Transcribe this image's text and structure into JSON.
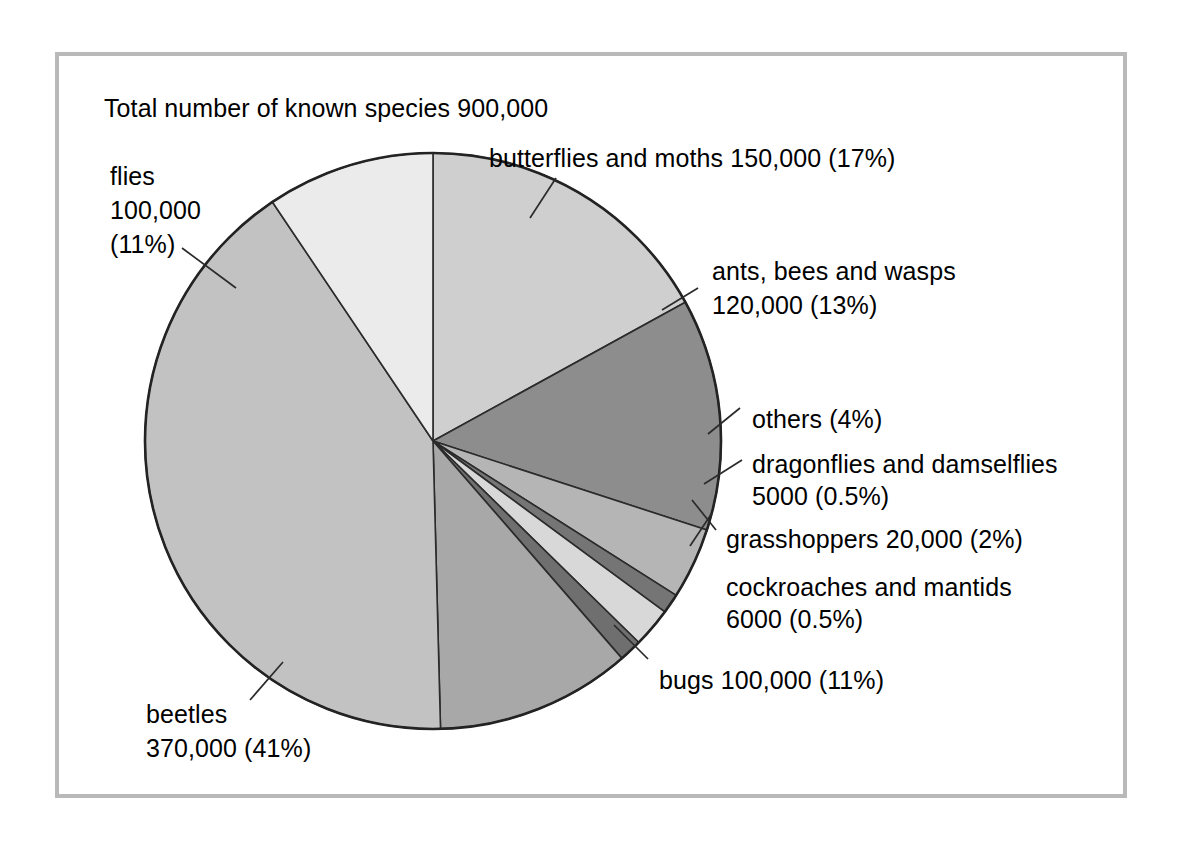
{
  "figure": {
    "title": "Total number of known species 900,000",
    "frame_color": "#b9b9b9",
    "background": "#ffffff",
    "outline_color": "#232323"
  },
  "chart_data": {
    "type": "pie",
    "title": "Total number of known species 900,000",
    "total_label": "900,000",
    "total_value": 900000,
    "units": "species",
    "legend": "none",
    "labels_placement": "callout",
    "categories": [
      "butterflies and moths",
      "ants, bees and wasps",
      "others",
      "dragonflies and damselflies",
      "grasshoppers",
      "cockroaches and mantids",
      "bugs",
      "beetles",
      "flies"
    ],
    "values": [
      150000,
      120000,
      36000,
      5000,
      20000,
      6000,
      100000,
      370000,
      100000
    ],
    "percents": [
      17,
      13,
      4,
      0.5,
      2,
      0.5,
      11,
      41,
      11
    ],
    "slices": [
      {
        "name": "butterflies and moths",
        "value": 150000,
        "value_text": "150,000",
        "percent": 17,
        "percent_text": "(17%)",
        "label": "butterflies and moths 150,000 (17%)",
        "color": "#cfcfcf",
        "start_deg": 0,
        "end_deg": 61.2
      },
      {
        "name": "ants, bees and wasps",
        "value": 120000,
        "value_text": "120,000",
        "percent": 13,
        "percent_text": "(13%)",
        "label_line1": "ants, bees and wasps",
        "label_line2": "120,000 (13%)",
        "color": "#8d8d8d",
        "start_deg": 61.2,
        "end_deg": 108.0
      },
      {
        "name": "others",
        "value": 36000,
        "value_text": "",
        "percent": 4,
        "percent_text": "(4%)",
        "label": "others (4%)",
        "color": "#b5b5b5",
        "start_deg": 108.0,
        "end_deg": 122.4
      },
      {
        "name": "dragonflies and damselflies",
        "value": 5000,
        "value_text": "5000",
        "percent": 0.5,
        "percent_text": "(0.5%)",
        "label_line1": "dragonflies and damselflies",
        "label_line2": "5000 (0.5%)",
        "color": "#757575",
        "start_deg": 122.4,
        "end_deg": 126.4
      },
      {
        "name": "grasshoppers",
        "value": 20000,
        "value_text": "20,000",
        "percent": 2,
        "percent_text": "(2%)",
        "label": "grasshoppers 20,000 (2%)",
        "color": "#d8d8d8",
        "start_deg": 126.4,
        "end_deg": 134.4
      },
      {
        "name": "cockroaches and mantids",
        "value": 6000,
        "value_text": "6000",
        "percent": 0.5,
        "percent_text": "(0.5%)",
        "label_line1": "cockroaches and mantids",
        "label_line2": "6000 (0.5%)",
        "color": "#6f6f6f",
        "start_deg": 134.4,
        "end_deg": 139.0
      },
      {
        "name": "bugs",
        "value": 100000,
        "value_text": "100,000",
        "percent": 11,
        "percent_text": "(11%)",
        "label": "bugs 100,000 (11%)",
        "color": "#a8a8a8",
        "start_deg": 139.0,
        "end_deg": 178.5
      },
      {
        "name": "beetles",
        "value": 370000,
        "value_text": "370,000",
        "percent": 41,
        "percent_text": "(41%)",
        "label_line1": "beetles",
        "label_line2": "370,000 (41%)",
        "color": "#c2c2c2",
        "start_deg": 178.5,
        "end_deg": 326.1
      },
      {
        "name": "flies",
        "value": 100000,
        "value_text": "100,000",
        "percent": 11,
        "percent_text": "(11%)",
        "label_line1": "flies",
        "label_line2": "100,000",
        "label_line3": "(11%)",
        "color": "#ebebeb",
        "start_deg": 326.1,
        "end_deg": 360
      }
    ]
  },
  "labels": {
    "flies_l1": "flies",
    "flies_l2": "100,000",
    "flies_l3": "(11%)",
    "butterflies": "butterflies and moths 150,000 (17%)",
    "ants_l1": "ants, bees and wasps",
    "ants_l2": "120,000 (13%)",
    "others": "others (4%)",
    "dragonflies_l1": "dragonflies and damselflies",
    "dragonflies_l2": "5000 (0.5%)",
    "grasshoppers": "grasshoppers 20,000 (2%)",
    "cockroaches_l1": "cockroaches and mantids",
    "cockroaches_l2": "6000 (0.5%)",
    "bugs": "bugs 100,000 (11%)",
    "beetles_l1": "beetles",
    "beetles_l2": "370,000 (41%)"
  }
}
